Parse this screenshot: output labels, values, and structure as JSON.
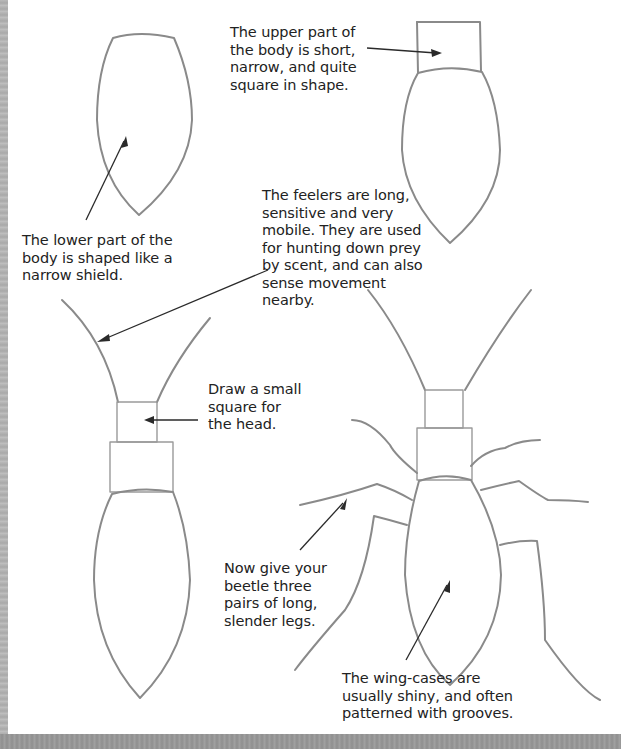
{
  "page": {
    "edge_color": "#b3b3b3",
    "bottom_band_color": "#999999",
    "drawing_stroke_color": "#8a8a8a",
    "text_color": "#222222"
  },
  "steps": [
    {
      "id": "step-1",
      "caption": "The lower part of the\nbody is shaped like a\nnarrow shield."
    },
    {
      "id": "step-2",
      "caption": "The upper part of\nthe body is short,\nnarrow, and quite\nsquare in shape."
    },
    {
      "id": "step-3",
      "caption_feelers": "The feelers are long,\nsensitive and very\nmobile. They are used\nfor hunting down prey\nby scent, and can also\nsense movement\nnearby.",
      "caption_head": "Draw a small\nsquare for\nthe head."
    },
    {
      "id": "step-4",
      "caption_legs": "Now give your\nbeetle three\npairs of long,\nslender legs.",
      "caption_wings": "The wing-cases are\nusually shiny, and often\npatterned with grooves."
    }
  ],
  "icons": {
    "arrow": "arrow-pointer-icon"
  }
}
